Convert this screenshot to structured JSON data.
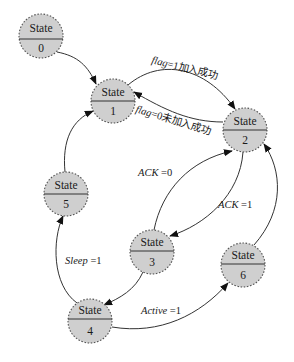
{
  "diagram": {
    "type": "state-machine",
    "colors": {
      "node_fill": "#cfcfcf",
      "node_stroke": "#555555",
      "edge": "#333333",
      "text": "#1a1a1a",
      "background": "#ffffff"
    },
    "nodes": [
      {
        "id": "0",
        "title": "State",
        "index": "0",
        "cx": 41,
        "cy": 36
      },
      {
        "id": "1",
        "title": "State",
        "index": "1",
        "cx": 113,
        "cy": 101
      },
      {
        "id": "2",
        "title": "State",
        "index": "2",
        "cx": 245,
        "cy": 130
      },
      {
        "id": "3",
        "title": "State",
        "index": "3",
        "cx": 152,
        "cy": 252
      },
      {
        "id": "4",
        "title": "State",
        "index": "4",
        "cx": 90,
        "cy": 321
      },
      {
        "id": "5",
        "title": "State",
        "index": "5",
        "cx": 66,
        "cy": 194
      },
      {
        "id": "6",
        "title": "State",
        "index": "6",
        "cx": 243,
        "cy": 265
      }
    ],
    "edges": [
      {
        "from": "0",
        "to": "1",
        "label": ""
      },
      {
        "from": "1",
        "to": "2",
        "label_var": "flag",
        "label_rest": "=1加入成功"
      },
      {
        "from": "2",
        "to": "1",
        "label_var": "flag",
        "label_rest": "=0未加入成功"
      },
      {
        "from": "3",
        "to": "2",
        "label_var": "ACK",
        "label_rest": " =0"
      },
      {
        "from": "2",
        "to": "3",
        "label_var": "ACK",
        "label_rest": " =1"
      },
      {
        "from": "3",
        "to": "4",
        "label": ""
      },
      {
        "from": "4",
        "to": "5",
        "label_var": "Sleep",
        "label_rest": " =1"
      },
      {
        "from": "5",
        "to": "1",
        "label": ""
      },
      {
        "from": "4",
        "to": "6",
        "label_var": "Active",
        "label_rest": " =1"
      },
      {
        "from": "6",
        "to": "2",
        "label": ""
      }
    ]
  }
}
